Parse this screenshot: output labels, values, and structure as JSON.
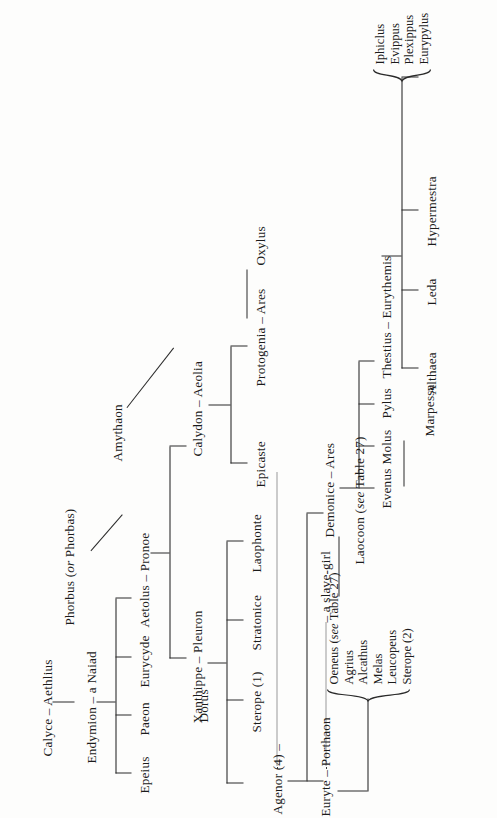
{
  "diagram": {
    "type": "genealogical-table",
    "orientation": "rotated-90-ccw",
    "nodes": {
      "calyce_aethlius": "Calyce – Aethlius",
      "endymion_naiad": "Endymion – a Naiad",
      "epeius": "Epeius",
      "paeon": "Paeon",
      "eurycyde": "Eurycyde",
      "aetolus_pronoe": "Aetolus – Pronoe",
      "phorbus": "Phorbus (",
      "phorbus_or": "or",
      "phorbus_alt": " Phorbas)",
      "dorus": "Dorus",
      "amythaon": "Amythaon",
      "calydon_aeolia": "Calydon – Aeolia",
      "epicaste": "Epicaste",
      "protogenia_ares": "Protogenia – Ares",
      "oxylus": "Oxylus",
      "xanthippe_pleuron": "Xanthippe – Pleuron",
      "sterope1": "Sterope (1)",
      "stratonice": "Stratonice",
      "laophonte": "Laophonte",
      "agenor": "Agenor (4) –",
      "slave_girl": "– a slave-girl",
      "euryte_porthaon": "Euryte – Porthaon",
      "laocoon_pre": "Laocoon (",
      "laocoon_it": "see",
      "laocoon_post": " Table 27)",
      "demonice_ares": "Demonice – Ares",
      "evenus": "Evenus",
      "molus": "Molus",
      "pylus": "Pylus",
      "marpessa": "Marpessa",
      "thestius_eurythemis": "Thestius – Eurythemis",
      "althaea": "Althaea",
      "leda": "Leda",
      "hypermestra": "Hypermestra"
    },
    "porthaon_children": {
      "items": [
        {
          "pre": "Oeneus (",
          "it": "see",
          "post": " Table 27)"
        },
        {
          "pre": "Agrius",
          "it": "",
          "post": ""
        },
        {
          "pre": "Alcathus",
          "it": "",
          "post": ""
        },
        {
          "pre": "Melas",
          "it": "",
          "post": ""
        },
        {
          "pre": "Leucopeus",
          "it": "",
          "post": ""
        },
        {
          "pre": "Sterope (2)",
          "it": "",
          "post": ""
        }
      ]
    },
    "thestius_sons": {
      "items": [
        "Iphiclus",
        "Evippus",
        "Plexippus",
        "Eurypylus"
      ]
    },
    "colors": {
      "ink": "#1b1b1b",
      "line": "#2a2a2a",
      "paper": "#fdfdfc"
    }
  }
}
